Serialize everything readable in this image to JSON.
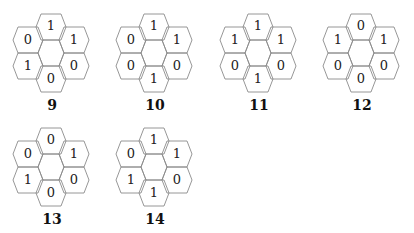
{
  "figures": [
    {
      "label": "9",
      "values": {
        "top": "1",
        "upper_left": "0",
        "upper_right": "1",
        "lower_left": "1",
        "lower_right": "0",
        "bottom": "0"
      }
    },
    {
      "label": "10",
      "values": {
        "top": "1",
        "upper_left": "0",
        "upper_right": "1",
        "lower_left": "0",
        "lower_right": "0",
        "bottom": "1"
      }
    },
    {
      "label": "11",
      "values": {
        "top": "1",
        "upper_left": "1",
        "upper_right": "1",
        "lower_left": "0",
        "lower_right": "0",
        "bottom": "1"
      }
    },
    {
      "label": "12",
      "values": {
        "top": "0",
        "upper_left": "1",
        "upper_right": "1",
        "lower_left": "0",
        "lower_right": "0",
        "bottom": "0"
      }
    },
    {
      "label": "13",
      "values": {
        "top": "0",
        "upper_left": "0",
        "upper_right": "1",
        "lower_left": "1",
        "lower_right": "0",
        "bottom": "0"
      }
    },
    {
      "label": "14",
      "values": {
        "top": "1",
        "upper_left": "0",
        "upper_right": "1",
        "lower_left": "1",
        "lower_right": "0",
        "bottom": "1"
      }
    }
  ],
  "colors": {
    "stroke": "#8a8a8a",
    "text": "#222222"
  }
}
